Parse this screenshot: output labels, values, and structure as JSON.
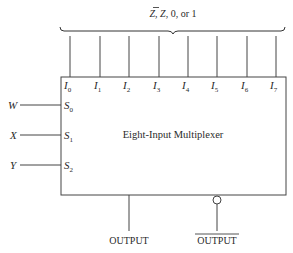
{
  "diagram": {
    "block_label": "Eight-Input Multiplexer",
    "input_group_label": "Z, Z̄, 0, or 1",
    "data_inputs": [
      {
        "name": "I",
        "sub": "0"
      },
      {
        "name": "I",
        "sub": "1"
      },
      {
        "name": "I",
        "sub": "2"
      },
      {
        "name": "I",
        "sub": "3"
      },
      {
        "name": "I",
        "sub": "4"
      },
      {
        "name": "I",
        "sub": "5"
      },
      {
        "name": "I",
        "sub": "6"
      },
      {
        "name": "I",
        "sub": "7"
      }
    ],
    "select_inputs": [
      {
        "signal": "W",
        "pin": "S",
        "sub": "0"
      },
      {
        "signal": "X",
        "pin": "S",
        "sub": "1"
      },
      {
        "signal": "Y",
        "pin": "S",
        "sub": "2"
      }
    ],
    "outputs": {
      "true_output": "OUTPUT",
      "inverted_output": "OUTPUT"
    }
  }
}
